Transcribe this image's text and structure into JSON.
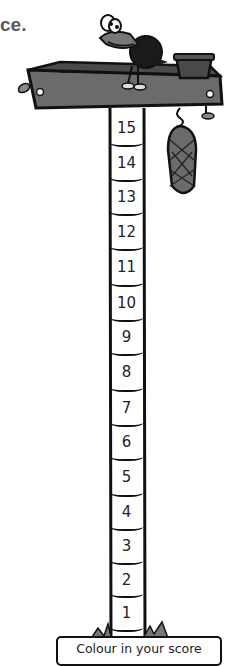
{
  "heading_fragment": "ce.",
  "score_pole": {
    "segments": [
      "15",
      "14",
      "13",
      "12",
      "11",
      "10",
      "9",
      "8",
      "7",
      "6",
      "5",
      "4",
      "3",
      "2",
      "1"
    ]
  },
  "caption": "Colour in your score",
  "colors": {
    "outline": "#111111",
    "tray_fill": "#6b6b6b",
    "tray_dark": "#4a4a4a",
    "crow": "#1a1a1a",
    "text_grey": "#5a5a5a"
  }
}
